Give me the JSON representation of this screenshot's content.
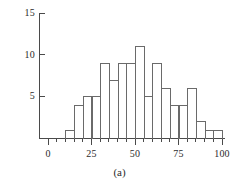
{
  "caption": "(a)",
  "colors": {
    "axis": "#4a4a4a",
    "bar_stroke": "#6a6a6a",
    "text": "#2b2b2b",
    "background": "#ffffff"
  },
  "axes": {
    "y_ticks": [
      {
        "value": 5,
        "label": "5"
      },
      {
        "value": 10,
        "label": "10"
      },
      {
        "value": 15,
        "label": "15"
      }
    ],
    "x_ticks": [
      {
        "value": 0,
        "label": "0"
      },
      {
        "value": 25,
        "label": "25"
      },
      {
        "value": 50,
        "label": "50"
      },
      {
        "value": 75,
        "label": "75"
      },
      {
        "value": 100,
        "label": "100"
      }
    ],
    "x_minor_step": 5
  },
  "chart_data": {
    "type": "bar",
    "title": "",
    "subtitle": "",
    "xlabel": "",
    "ylabel": "",
    "grid": false,
    "legend": null,
    "xlim": [
      0,
      105
    ],
    "ylim": [
      0,
      15
    ],
    "bin_width": 5,
    "bin_edges": [
      10,
      15,
      20,
      25,
      30,
      35,
      40,
      45,
      50,
      55,
      60,
      65,
      70,
      75,
      80,
      85,
      90,
      95,
      100
    ],
    "categories": [
      "10-15",
      "15-20",
      "20-25",
      "25-30",
      "30-35",
      "35-40",
      "40-45",
      "45-50",
      "50-55",
      "55-60",
      "60-65",
      "65-70",
      "70-75",
      "75-80",
      "80-85",
      "85-90",
      "90-95",
      "95-100"
    ],
    "values": [
      1,
      4,
      5,
      5,
      9,
      7,
      9,
      9,
      11,
      5,
      9,
      6,
      4,
      4,
      6,
      2,
      1,
      1
    ],
    "annotations": [
      "(a)"
    ]
  }
}
